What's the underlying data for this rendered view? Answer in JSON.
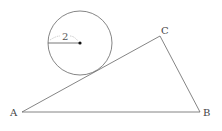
{
  "diagram": {
    "type": "geometry",
    "circle": {
      "center": [
        80,
        43
      ],
      "radius_px": 32,
      "radius_label": "2"
    },
    "triangle": {
      "vertices": {
        "A": {
          "label": "A",
          "point": [
            22,
            112
          ],
          "label_pos": [
            11,
            117
          ]
        },
        "B": {
          "label": "B",
          "point": [
            200,
            112
          ],
          "label_pos": [
            203,
            117
          ]
        },
        "C": {
          "label": "C",
          "point": [
            160,
            36
          ],
          "label_pos": [
            162,
            34
          ]
        }
      }
    },
    "colors": {
      "stroke": "#555555",
      "text": "#444444",
      "dash": "#aaaaaa",
      "background": "#ffffff"
    }
  }
}
